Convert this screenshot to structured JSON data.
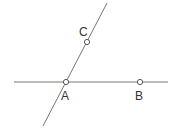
{
  "diagram": {
    "lines": [
      {
        "name": "horizontal-line",
        "x1": 14,
        "y1": 82,
        "x2": 168,
        "y2": 82,
        "color": "#777777"
      },
      {
        "name": "oblique-line",
        "x1": 107,
        "y1": 3,
        "x2": 43,
        "y2": 126,
        "color": "#777777"
      }
    ],
    "points": [
      {
        "id": "A",
        "label": "A",
        "x": 66,
        "y": 82,
        "label_x": 61,
        "label_y": 100
      },
      {
        "id": "B",
        "label": "B",
        "x": 140,
        "y": 82,
        "label_x": 135,
        "label_y": 100
      },
      {
        "id": "C",
        "label": "C",
        "x": 87,
        "y": 42,
        "label_x": 79,
        "label_y": 36
      }
    ]
  }
}
